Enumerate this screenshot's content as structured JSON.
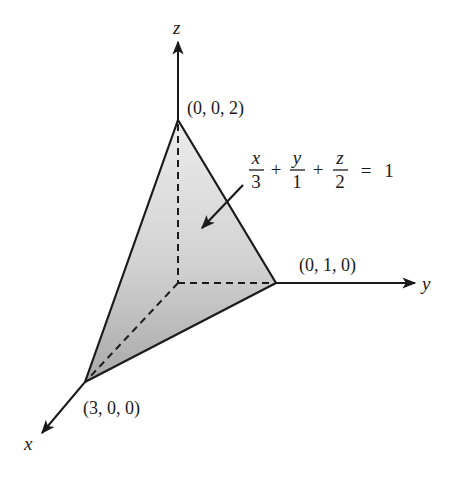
{
  "diagram": {
    "axes": {
      "x": {
        "label": "x"
      },
      "y": {
        "label": "y"
      },
      "z": {
        "label": "z"
      }
    },
    "points": {
      "x_intercept": {
        "label": "(3, 0, 0)"
      },
      "y_intercept": {
        "label": "(0, 1, 0)"
      },
      "z_intercept": {
        "label": "(0, 0, 2)"
      }
    },
    "equation": {
      "term1": {
        "num": "x",
        "den": "3"
      },
      "term2": {
        "num": "y",
        "den": "1"
      },
      "term3": {
        "num": "z",
        "den": "2"
      },
      "plus": "+",
      "equals": "=",
      "rhs": "1"
    },
    "colors": {
      "line": "#1a1a1a",
      "fill_top": "#e6e6e6",
      "fill_bottom": "#a9a9a9"
    }
  }
}
